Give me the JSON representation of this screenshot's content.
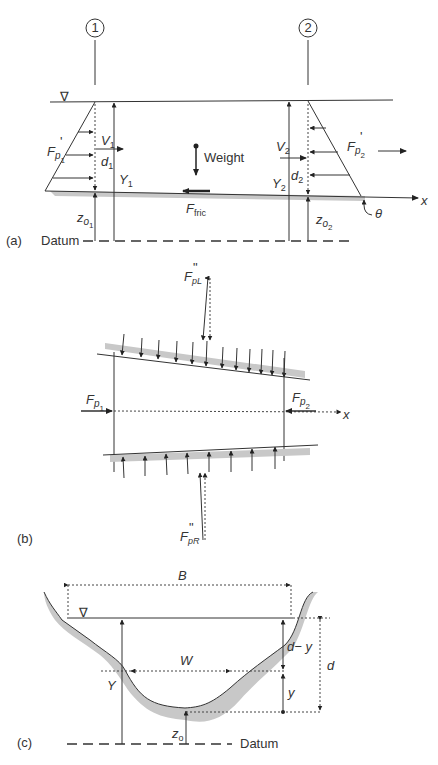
{
  "figure": {
    "panel_a": {
      "label": "(a)",
      "section_1": "1",
      "section_2": "2",
      "datum": "Datum",
      "water_surface_symbol": "∇",
      "F_p1": {
        "main": "F",
        "sub": "p",
        "subsub": "1",
        "prime": "'"
      },
      "F_p2": {
        "main": "F",
        "sub": "p",
        "subsub": "2",
        "prime": "'"
      },
      "V1": {
        "main": "V",
        "sub": "1"
      },
      "V2": {
        "main": "V",
        "sub": "2"
      },
      "d1": {
        "main": "d",
        "sub": "1"
      },
      "d2": {
        "main": "d",
        "sub": "2"
      },
      "Y1": {
        "main": "Y",
        "sub": "1"
      },
      "Y2": {
        "main": "Y",
        "sub": "2"
      },
      "zo1": {
        "main": "z",
        "sub": "o",
        "subsub": "1"
      },
      "zo2": {
        "main": "z",
        "sub": "o",
        "subsub": "2"
      },
      "weight": "Weight",
      "F_fric": {
        "main": "F",
        "sub": "fric"
      },
      "x_axis": "x",
      "theta": "θ"
    },
    "panel_b": {
      "label": "(b)",
      "F_p1": {
        "main": "F",
        "sub": "p",
        "subsub": "1",
        "prime": "'"
      },
      "F_p2": {
        "main": "F",
        "sub": "p",
        "subsub": "2",
        "prime": "'"
      },
      "F_pL": {
        "main": "F",
        "sub": "pL",
        "prime": "\""
      },
      "F_pR": {
        "main": "F",
        "sub": "pR",
        "prime": "\""
      },
      "x_axis": "x"
    },
    "panel_c": {
      "label": "(c)",
      "B": "B",
      "W": "W",
      "Y": "Y",
      "d": "d",
      "d_minus_y": "d− y",
      "y": "y",
      "zo": {
        "main": "z",
        "sub": "o"
      },
      "datum": "Datum",
      "water_surface_symbol": "∇"
    }
  }
}
